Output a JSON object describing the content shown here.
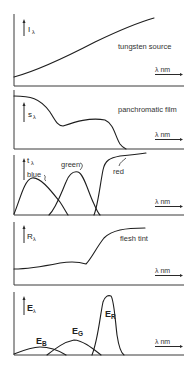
{
  "figure": {
    "panels": [
      {
        "id": "illuminant",
        "y_symbol": "I",
        "y_subscript": "λ",
        "x_label": "λ nm",
        "caption": "tungsten source",
        "curves": [
          {
            "name": "tungsten-spd",
            "path": "M14,77 C40,70 70,55 95,42 C120,30 140,22 154,18"
          }
        ]
      },
      {
        "id": "film-sensitivity",
        "y_symbol": "s",
        "y_subscript": "λ",
        "x_label": "λ nm",
        "caption": "panchromatic film",
        "curves": [
          {
            "name": "panchromatic-sensitivity",
            "path": "M14,96 C30,96 40,98 50,112 C56,122 58,126 63,126 C75,122 90,117 105,120 C114,124 115,136 120,144 C122,147 124,148 126,149"
          }
        ]
      },
      {
        "id": "filter-transmission",
        "y_symbol": "t",
        "y_subscript": "λ",
        "x_label": "λ nm",
        "caption": "",
        "curve_labels": [
          {
            "text": "blue",
            "x": 27,
            "y": 177
          },
          {
            "text": "green",
            "x": 61,
            "y": 167
          },
          {
            "text": "red",
            "x": 113,
            "y": 172
          }
        ],
        "curves": [
          {
            "name": "blue-filter",
            "path": "M14,214 C20,200 24,180 32,178 C40,176 52,192 60,202 C64,208 66,212 68,215"
          },
          {
            "name": "green-filter",
            "path": "M49,215 C56,208 60,196 66,182 C70,172 74,171 78,172 C84,174 88,192 94,204 C97,211 99,214 100,215"
          },
          {
            "name": "red-filter",
            "path": "M94,215 C98,205 100,185 103,170 C105,160 110,158 120,156 C132,155 140,154 146,153"
          }
        ]
      },
      {
        "id": "subject-reflectance",
        "y_symbol": "R",
        "y_subscript": "λ",
        "x_label": "λ nm",
        "caption": "flesh tint",
        "curves": [
          {
            "name": "flesh-tint-reflectance",
            "path": "M14,269 C30,269 45,266 60,263 C72,261 80,262 86,264 C92,258 96,248 104,238 C112,230 125,228 145,228"
          }
        ]
      },
      {
        "id": "exposure",
        "y_symbol": "E",
        "y_subscript": "λ",
        "x_label": "λ nm",
        "caption": "",
        "curve_labels": [
          {
            "symbol": "E",
            "subscript": "B",
            "x": 36,
            "y": 346
          },
          {
            "symbol": "E",
            "subscript": "G",
            "x": 73,
            "y": 336
          },
          {
            "symbol": "E",
            "subscript": "R",
            "x": 104,
            "y": 319
          }
        ],
        "curves": [
          {
            "name": "exposure-blue",
            "path": "M14,354 C24,350 32,347 40,347 C50,347 58,350 66,355"
          },
          {
            "name": "exposure-green",
            "path": "M47,355 C56,348 64,342 74,340 C82,340 92,348 101,355"
          },
          {
            "name": "exposure-red",
            "path": "M92,355 C98,340 100,316 103,302 C105,296 108,295 111,296 C114,300 115,318 117,335 C119,348 121,353 124,355"
          }
        ]
      }
    ]
  }
}
